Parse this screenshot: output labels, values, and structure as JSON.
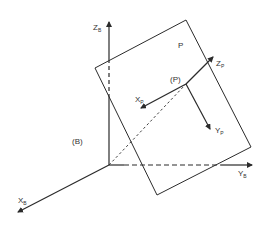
{
  "diagram": {
    "type": "coordinate-frames",
    "colors": {
      "line": "#2b2b2b",
      "background": "#ffffff",
      "text": "#333333"
    },
    "base_frame": {
      "name": "(B)",
      "label": "(B)",
      "origin": [
        109,
        165
      ],
      "axes": {
        "z": {
          "main": "Z",
          "sub": "B"
        },
        "y": {
          "main": "Y",
          "sub": "B"
        },
        "x": {
          "main": "X",
          "sub": "B"
        }
      }
    },
    "plane": {
      "label": "P"
    },
    "point_frame": {
      "label": "(P)",
      "origin": [
        186,
        84
      ],
      "axes": {
        "z": {
          "main": "Z",
          "sub": "P"
        },
        "x": {
          "main": "X",
          "sub": "P"
        },
        "y": {
          "main": "Y",
          "sub": "P"
        }
      }
    }
  }
}
